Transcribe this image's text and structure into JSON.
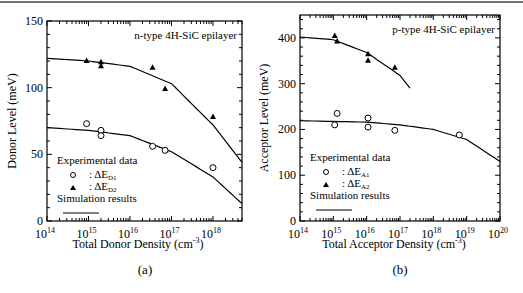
{
  "chart_data": [
    {
      "type": "scatter",
      "panel": "(a)",
      "title": "n-type 4H-SiC epilayer",
      "xlabel": "Total Donor Density  (cm-3)",
      "ylabel": "Donor Level  (meV)",
      "xscale": "log",
      "xlim": [
        100000000000000.0,
        5e+18
      ],
      "ylim": [
        0,
        150
      ],
      "xticks": [
        "10^14",
        "10^15",
        "10^16",
        "10^17",
        "10^18"
      ],
      "yticks": [
        0,
        50,
        100,
        150
      ],
      "legend": {
        "title": "Experimental data",
        "entries": [
          ": ΔE_D1",
          ": ΔE_D2"
        ],
        "sim": "Simulation results"
      },
      "series": [
        {
          "name": "ΔE_D1",
          "marker": "open-circle",
          "x": [
            900000000000000.0,
            2000000000000000.0,
            2000000000000000.0,
            3.5e+16,
            7e+16,
            1e+18
          ],
          "y": [
            73,
            68,
            64,
            56,
            53,
            40
          ]
        },
        {
          "name": "ΔE_D2",
          "marker": "filled-triangle",
          "x": [
            900000000000000.0,
            2000000000000000.0,
            2000000000000000.0,
            3.5e+16,
            7e+16,
            1e+18
          ],
          "y": [
            120,
            119,
            116,
            115,
            99,
            78
          ]
        },
        {
          "name": "Simulation D1",
          "type": "line",
          "x": [
            100000000000000.0,
            1000000000000000.0,
            1e+16,
            1e+17,
            1e+18,
            5e+18
          ],
          "y": [
            70,
            68,
            64,
            52,
            33,
            13
          ]
        },
        {
          "name": "Simulation D2",
          "type": "line",
          "x": [
            100000000000000.0,
            1000000000000000.0,
            1e+16,
            1e+17,
            1e+18,
            5e+18
          ],
          "y": [
            122,
            120,
            116,
            103,
            72,
            44
          ]
        }
      ]
    },
    {
      "type": "scatter",
      "panel": "(b)",
      "title": "p-type 4H-SiC epilayer",
      "xlabel": "Total Acceptor Density (cm-3)",
      "ylabel": "Acceptor Level  (meV)",
      "xscale": "log",
      "xlim": [
        100000000000000.0,
        1e+20
      ],
      "ylim": [
        0,
        450
      ],
      "xticks": [
        "10^14",
        "10^15",
        "10^16",
        "10^17",
        "10^18",
        "10^19",
        "10^20"
      ],
      "yticks": [
        0,
        100,
        200,
        300,
        400
      ],
      "legend": {
        "title": "Experimental data",
        "entries": [
          ": ΔE_A1",
          ": ΔE_A2"
        ],
        "sim": "Simulation results"
      },
      "series": [
        {
          "name": "ΔE_A1",
          "marker": "open-circle",
          "x": [
            1100000000000000.0,
            1300000000000000.0,
            1.1e+16,
            1.1e+16,
            7e+16,
            6e+18
          ],
          "y": [
            210,
            235,
            225,
            205,
            198,
            188
          ]
        },
        {
          "name": "ΔE_A2",
          "marker": "filled-triangle",
          "x": [
            1100000000000000.0,
            1300000000000000.0,
            1.1e+16,
            1.1e+16,
            7e+16
          ],
          "y": [
            404,
            392,
            364,
            350,
            335
          ]
        },
        {
          "name": "Simulation A1",
          "type": "line",
          "x": [
            100000000000000.0,
            1e+16,
            1e+17,
            1e+18,
            1e+19,
            1e+20
          ],
          "y": [
            219,
            216,
            210,
            200,
            178,
            130
          ]
        },
        {
          "name": "Simulation A2",
          "type": "line",
          "x": [
            100000000000000.0,
            1000000000000000.0,
            1e+16,
            1e+17,
            2e+17
          ],
          "y": [
            402,
            396,
            368,
            318,
            290
          ]
        }
      ]
    }
  ],
  "labels": {
    "a": "(a)",
    "b": "(b)"
  }
}
